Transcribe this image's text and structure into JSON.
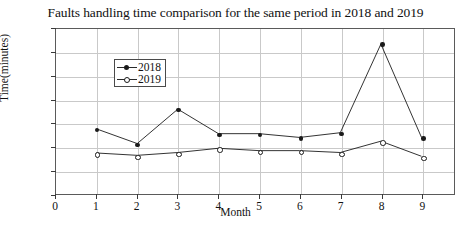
{
  "chart_data": {
    "type": "line",
    "title": "Faults handling time comparison for the same period in 2018 and 2019",
    "xlabel": "Month",
    "ylabel": "Time(minutes)",
    "x": [
      1,
      2,
      3,
      4,
      5,
      6,
      7,
      8,
      9
    ],
    "xlim": [
      0,
      9.8
    ],
    "ylim": [
      0,
      350
    ],
    "xticks": [
      0,
      1,
      2,
      3,
      4,
      5,
      6,
      7,
      8,
      9
    ],
    "yticks": [
      0,
      50,
      100,
      150,
      200,
      250,
      300,
      350
    ],
    "grid": true,
    "legend_position": "upper-left",
    "series": [
      {
        "name": "2018",
        "color": "#1a1a1a",
        "marker": "filled-circle",
        "values": [
          138,
          107,
          180,
          128,
          128,
          120,
          130,
          318,
          120
        ]
      },
      {
        "name": "2019",
        "color": "#1a1a1a",
        "marker": "open-circle",
        "values": [
          87,
          82,
          88,
          97,
          92,
          92,
          88,
          112,
          80
        ]
      }
    ]
  }
}
